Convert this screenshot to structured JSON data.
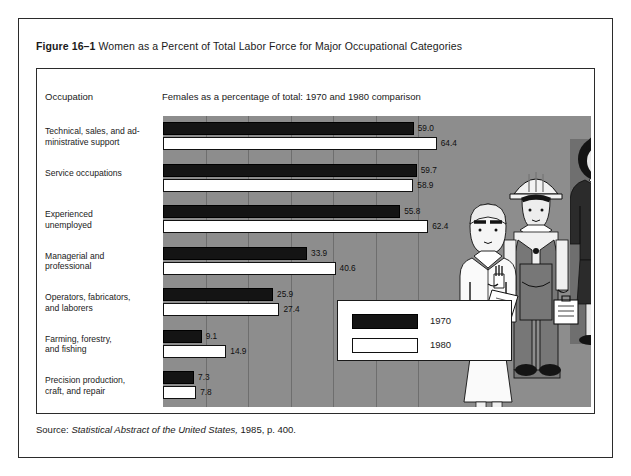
{
  "figure": {
    "number": "Figure 16–1",
    "title": "Women as a Percent of Total Labor Force for Major Occupational Categories"
  },
  "header": {
    "occupation_label": "Occupation",
    "subtitle": "Females as a percentage of total: 1970 and 1980 comparison"
  },
  "legend": {
    "items": [
      {
        "label": "1970",
        "color": "#141414"
      },
      {
        "label": "1980",
        "color": "#ffffff"
      }
    ]
  },
  "source": {
    "prefix": "Source: ",
    "italic": "Statistical Abstract of the United States,",
    "suffix": " 1985, p. 400."
  },
  "illustration": {
    "name": "three-working-women-illustration",
    "figures": [
      "nurse-in-white-coat",
      "construction-worker-with-hard-hat",
      "businesswoman-with-briefcase"
    ]
  },
  "chart_data": {
    "type": "bar",
    "orientation": "horizontal",
    "title": "Women as a Percent of Total Labor Force for Major Occupational Categories",
    "subtitle": "Females as a percentage of total: 1970 and 1980 comparison",
    "xlabel": "",
    "ylabel": "Occupation",
    "xlim": [
      0,
      70
    ],
    "grid": true,
    "grid_interval": 10,
    "legend_position": "inside-bottom-right",
    "categories": [
      "Technical, sales, and ad-\nministrative support",
      "Service occupations",
      "Experienced\nunemployed",
      "Managerial and\nprofessional",
      "Operators, fabricators,\nand laborers",
      "Farming, forestry,\nand fishing",
      "Precision production,\ncraft, and repair"
    ],
    "series": [
      {
        "name": "1970",
        "values": [
          59.0,
          59.7,
          55.8,
          33.9,
          25.9,
          9.1,
          7.3
        ]
      },
      {
        "name": "1980",
        "values": [
          64.4,
          58.9,
          62.4,
          40.6,
          27.4,
          14.9,
          7.8
        ]
      }
    ]
  }
}
